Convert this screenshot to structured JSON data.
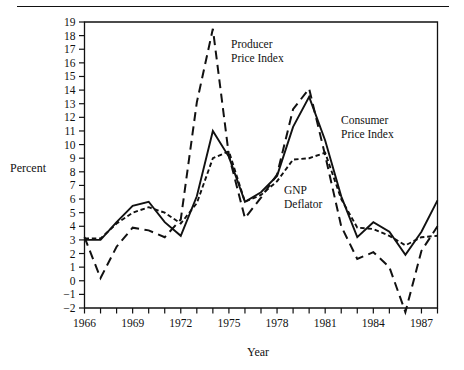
{
  "figure": {
    "y_axis_title": "Percent",
    "x_axis_title": "Year"
  },
  "annotations": {
    "producer": {
      "line1": "Producer",
      "line2": "Price Index"
    },
    "consumer": {
      "line1": "Consumer",
      "line2": "Price Index"
    },
    "gnp": {
      "line1": "GNP",
      "line2": "Deflator"
    }
  },
  "chart_data": {
    "type": "line",
    "title": "",
    "xlabel": "Year",
    "ylabel": "Percent",
    "xlim": [
      1966,
      1988
    ],
    "ylim": [
      -2,
      19
    ],
    "grid": false,
    "legend": "inline annotations",
    "x_tick_labels": [
      "1966",
      "1969",
      "1972",
      "1975",
      "1978",
      "1981",
      "1984",
      "1987"
    ],
    "x_tick_label_years": [
      1966,
      1969,
      1972,
      1975,
      1978,
      1981,
      1984,
      1987
    ],
    "x_minor_ticks_every": 1,
    "y_tick_labels": [
      "19",
      "18",
      "17",
      "16",
      "15",
      "14",
      "13",
      "12",
      "11",
      "10",
      "9",
      "8",
      "7",
      "6",
      "5",
      "4",
      "3",
      "2",
      "1",
      "0",
      "−1",
      "−2"
    ],
    "y_tick_values": [
      19,
      18,
      17,
      16,
      15,
      14,
      13,
      12,
      11,
      10,
      9,
      8,
      7,
      6,
      5,
      4,
      3,
      2,
      1,
      0,
      -1,
      -2
    ],
    "x": [
      1966,
      1967,
      1968,
      1969,
      1970,
      1971,
      1972,
      1973,
      1974,
      1975,
      1976,
      1977,
      1978,
      1979,
      1980,
      1981,
      1982,
      1983,
      1984,
      1985,
      1986,
      1987,
      1988
    ],
    "series": [
      {
        "name": "Consumer Price Index",
        "style": "solid",
        "values": [
          3.0,
          3.0,
          4.3,
          5.5,
          5.8,
          4.3,
          3.3,
          6.2,
          11.0,
          9.1,
          5.8,
          6.5,
          7.7,
          11.3,
          13.5,
          10.3,
          6.2,
          3.2,
          4.3,
          3.6,
          1.9,
          3.6,
          5.9
        ]
      },
      {
        "name": "GNP Deflator",
        "style": "dotted",
        "values": [
          3.1,
          3.1,
          4.2,
          5.0,
          5.4,
          5.0,
          4.2,
          5.7,
          9.0,
          9.5,
          5.8,
          6.3,
          7.3,
          8.9,
          9.0,
          9.4,
          6.0,
          3.9,
          3.8,
          3.3,
          2.6,
          3.2,
          3.3
        ]
      },
      {
        "name": "Producer Price Index",
        "style": "dashed",
        "values": [
          3.2,
          0.2,
          2.5,
          3.9,
          3.7,
          3.2,
          4.5,
          13.1,
          18.5,
          9.2,
          4.6,
          6.1,
          7.8,
          12.6,
          14.1,
          9.2,
          4.0,
          1.6,
          2.1,
          1.0,
          -2.3,
          2.2,
          4.0
        ]
      }
    ]
  }
}
